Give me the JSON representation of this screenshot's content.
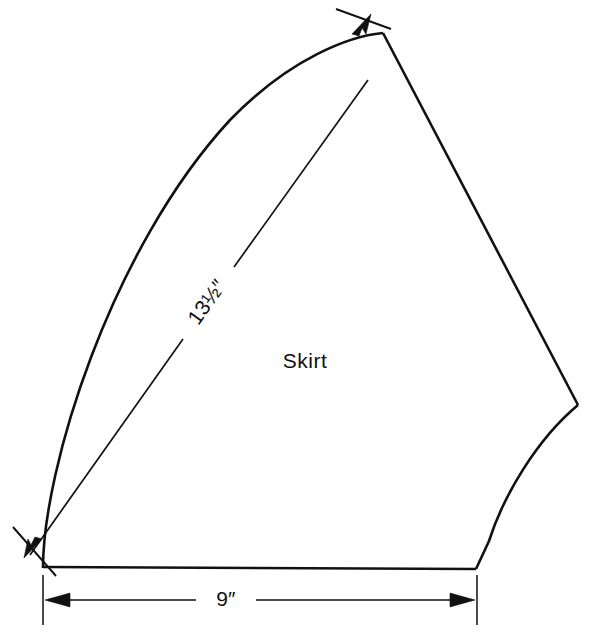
{
  "diagram": {
    "piece_label": "Skirt",
    "background_color": "#ffffff",
    "line_color": "#111111",
    "dimensions": [
      {
        "id": "radius",
        "label": "13½″",
        "value": 13.5,
        "unit": "inch",
        "orientation": "diagonal",
        "placement": "from lower-left pivot to upper apex"
      },
      {
        "id": "width",
        "label": "9″",
        "value": 9,
        "unit": "inch",
        "orientation": "horizontal",
        "placement": "below bottom edge"
      }
    ],
    "geometry": {
      "outline": "M 43 568 L 43 530 C 44 420 120 200 250 95 C 300 56 350 36 383 33 L 578 405 C 540 440 505 500 490 545 L 476 569 L 43 567 Z",
      "bottom_edge": "M 43 567 L 476 569",
      "left_arc": "M 43 568 C 43 470 110 250 230 120 C 290 58 350 36 383 33",
      "right_edge": "M 383 33 L 578 405",
      "hem_curve": "M 578 405 C 536 440 503 497 489 541 L 476 569",
      "radius_dim_segment_1": "M 30 555 L 183 339",
      "radius_dim_segment_2": "M 234 267 L 368 80",
      "width_dim_line": "M 48 600 L 472 600",
      "width_ext_left": "M 43 575 L 43 625",
      "width_ext_right": "M 477 575 L 477 625",
      "radius_tick_bottom": "M 13 527 L 56 576",
      "radius_tick_top": "M 336 9 L 391 29"
    }
  }
}
